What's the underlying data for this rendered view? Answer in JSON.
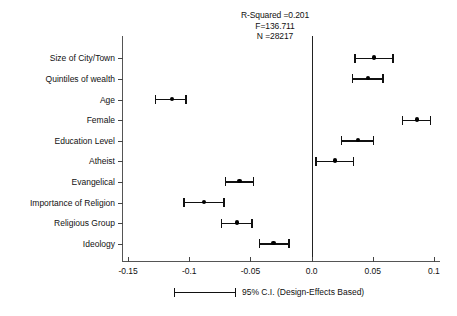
{
  "chart_data": {
    "type": "scatter",
    "title": "",
    "annotations": [
      "R-Squared =0.201",
      "F=136.711",
      "N =28217"
    ],
    "xlabel": "",
    "ylabel": "",
    "xlim": [
      -0.155,
      0.105
    ],
    "xticks": [
      -0.15,
      -0.1,
      -0.05,
      0.0,
      0.05,
      0.1
    ],
    "xticklabels": [
      "-0.15",
      "-0.1",
      "-0.05",
      "0.0",
      "0.05",
      "0.1"
    ],
    "grid": false,
    "reference_line": 0.0,
    "legend_position": "bottom",
    "legend_entries": [
      "95% C.I. (Design-Effects Based)"
    ],
    "categories": [
      "Size of City/Town",
      "Quintiles of wealth",
      "Age",
      "Female",
      "Education Level",
      "Atheist",
      "Evangelical",
      "Importance of Religion",
      "Religious Group",
      "Ideology"
    ],
    "points": [
      {
        "label": "Size of City/Town",
        "estimate": 0.051,
        "ci_low": 0.035,
        "ci_high": 0.067
      },
      {
        "label": "Quintiles of wealth",
        "estimate": 0.046,
        "ci_low": 0.033,
        "ci_high": 0.059
      },
      {
        "label": "Age",
        "estimate": -0.114,
        "ci_low": -0.128,
        "ci_high": -0.102
      },
      {
        "label": "Female",
        "estimate": 0.086,
        "ci_low": 0.074,
        "ci_high": 0.098
      },
      {
        "label": "Education Level",
        "estimate": 0.038,
        "ci_low": 0.024,
        "ci_high": 0.051
      },
      {
        "label": "Atheist",
        "estimate": 0.019,
        "ci_low": 0.003,
        "ci_high": 0.035
      },
      {
        "label": "Evangelical",
        "estimate": -0.059,
        "ci_low": -0.071,
        "ci_high": -0.047
      },
      {
        "label": "Importance of Religion",
        "estimate": -0.088,
        "ci_low": -0.105,
        "ci_high": -0.071
      },
      {
        "label": "Religious Group",
        "estimate": -0.061,
        "ci_low": -0.074,
        "ci_high": -0.048
      },
      {
        "label": "Ideology",
        "estimate": -0.031,
        "ci_low": -0.043,
        "ci_high": -0.018
      }
    ]
  },
  "legend": {
    "text": "95% C.I. (Design-Effects Based)"
  },
  "colors": {
    "marker": "#000000",
    "axis": "#444444",
    "reference_line": "#222222",
    "background": "#ffffff"
  }
}
